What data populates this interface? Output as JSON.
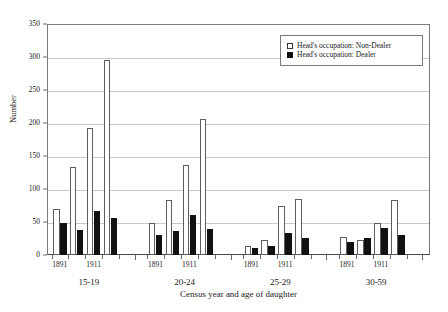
{
  "chart_data": {
    "type": "bar",
    "title": "",
    "xlabel": "Census year and age of daughter",
    "ylabel": "Number",
    "ylim": [
      0,
      350
    ],
    "ytick_step": 50,
    "yticks": [
      0,
      50,
      100,
      150,
      200,
      250,
      300,
      350
    ],
    "grid": true,
    "legend_position": "top-right-inside",
    "groups": [
      {
        "age_group": "15-19",
        "year_ticks": [
          "1891",
          "1911"
        ]
      },
      {
        "age_group": "20-24",
        "year_ticks": [
          "1891",
          "1911"
        ]
      },
      {
        "age_group": "25-29",
        "year_ticks": [
          "1891",
          "1911"
        ]
      },
      {
        "age_group": "30-59",
        "year_ticks": [
          "1891",
          "1911"
        ]
      }
    ],
    "categories": [
      "15-19 / 1",
      "15-19 / 2",
      "15-19 / 3",
      "15-19 / 4",
      "20-24 / 1",
      "20-24 / 2",
      "20-24 / 3",
      "20-24 / 4",
      "25-29 / 1",
      "25-29 / 2",
      "25-29 / 3",
      "25-29 / 4",
      "30-59 / 1",
      "30-59 / 2",
      "30-59 / 3",
      "30-59 / 4"
    ],
    "series": [
      {
        "name": "Head's occupation: Non-Dealer",
        "color": "#ffffff",
        "edge_color": "#5d5d5d",
        "values": [
          70,
          134,
          192,
          295,
          48,
          84,
          137,
          206,
          13,
          23,
          75,
          85,
          27,
          22,
          48,
          83
        ]
      },
      {
        "name": "Head's occupation: Dealer",
        "color": "#111111",
        "edge_color": "#111111",
        "values": [
          48,
          38,
          67,
          56,
          31,
          36,
          60,
          40,
          11,
          14,
          33,
          26,
          20,
          26,
          41,
          31
        ]
      }
    ]
  },
  "legend": {
    "items": [
      {
        "label": "Head's occupation: Non-Dealer",
        "swatch": "nondealer"
      },
      {
        "label": "Head's occupation: Dealer",
        "swatch": "dealer"
      }
    ]
  },
  "axes": {
    "y_title": "Number",
    "x_title": "Census year and age of daughter",
    "y_tick_labels": [
      "350",
      "300",
      "250",
      "200",
      "150",
      "100",
      "50",
      "0"
    ]
  }
}
